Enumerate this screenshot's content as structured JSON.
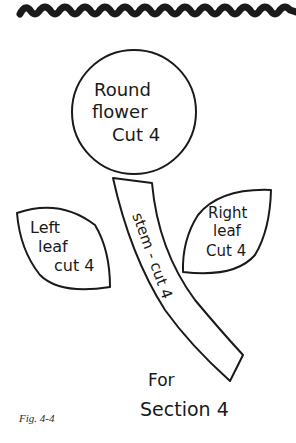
{
  "figure": {
    "caption": "Fig. 4-4",
    "colors": {
      "ink": "#1a1a1a",
      "background": "#ffffff"
    },
    "border": {
      "type": "ric-rac-trim",
      "position": "top"
    },
    "pieces": {
      "flower": {
        "shape": "circle",
        "lines": [
          "Round",
          "flower",
          "Cut 4"
        ]
      },
      "left_leaf": {
        "shape": "leaf",
        "lines": [
          "Left",
          "leaf",
          "cut 4"
        ]
      },
      "right_leaf": {
        "shape": "leaf",
        "lines": [
          "Right",
          "leaf",
          "Cut 4"
        ]
      },
      "stem": {
        "shape": "curved-strip",
        "label": "stem - cut 4"
      }
    },
    "note": {
      "lines": [
        "For",
        "Section 4"
      ]
    }
  }
}
